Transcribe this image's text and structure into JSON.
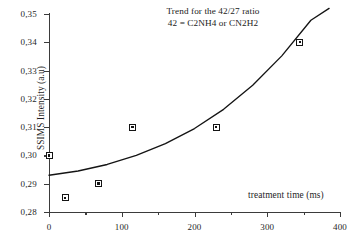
{
  "chart_data": {
    "type": "scatter",
    "title": "Trend for the 42/27 ratio",
    "subtitle": "42 = C2NH4 or CN2H2",
    "xlabel": "treatment time (ms)",
    "ylabel": "SSIMS Intensity (a.u)",
    "xlim": [
      0,
      400
    ],
    "ylim": [
      0.28,
      0.35
    ],
    "grid": false,
    "legend": "none",
    "x_ticks": [
      0,
      100,
      200,
      300,
      400
    ],
    "x_tick_labels": [
      "0",
      "100",
      "200",
      "300",
      "400"
    ],
    "x_minor_ticks": [
      50,
      150,
      250,
      350
    ],
    "y_ticks": [
      0.28,
      0.29,
      0.3,
      0.31,
      0.32,
      0.33,
      0.34,
      0.35
    ],
    "y_tick_labels": [
      "0,28",
      "0,29",
      "0,30",
      "0,31",
      "0,32",
      "0,33",
      "0,34",
      "0,35"
    ],
    "marker_style": "open-square-with-center-dot",
    "points": [
      {
        "x": 0,
        "y": 0.3
      },
      {
        "x": 22,
        "y": 0.285
      },
      {
        "x": 68,
        "y": 0.29
      },
      {
        "x": 115,
        "y": 0.31
      },
      {
        "x": 230,
        "y": 0.31
      },
      {
        "x": 345,
        "y": 0.34
      }
    ],
    "series": [
      {
        "name": "42/27 ratio data",
        "x": [
          0,
          22,
          68,
          115,
          230,
          345
        ],
        "values": [
          0.3,
          0.285,
          0.29,
          0.31,
          0.31,
          0.34
        ]
      },
      {
        "name": "trend curve (exponential fit)",
        "type": "line",
        "x": [
          0,
          40,
          80,
          120,
          160,
          200,
          240,
          280,
          320,
          360,
          385
        ],
        "values": [
          0.293,
          0.2945,
          0.2968,
          0.3,
          0.3042,
          0.3095,
          0.3163,
          0.3248,
          0.3352,
          0.3478,
          0.352
        ]
      }
    ]
  },
  "ticks": {
    "y": [
      "0,35",
      "0,34",
      "0,33",
      "0,32",
      "0,31",
      "0,30",
      "0,29",
      "0,28"
    ],
    "x": [
      "0",
      "100",
      "200",
      "300",
      "400"
    ]
  },
  "labels": {
    "title_line1": "Trend for the 42/27 ratio",
    "title_line2": "42 = C2NH4 or CN2H2",
    "y_axis": "SSIMS Intensity (a.u)",
    "x_axis": "treatment time (ms)"
  },
  "colors": {
    "axis": "#3b3b3b",
    "curve": "#141414",
    "marker_fill": "#ffffff",
    "marker_edge": "#141414",
    "text": "#1f1f1f",
    "background": "#ffffff"
  }
}
